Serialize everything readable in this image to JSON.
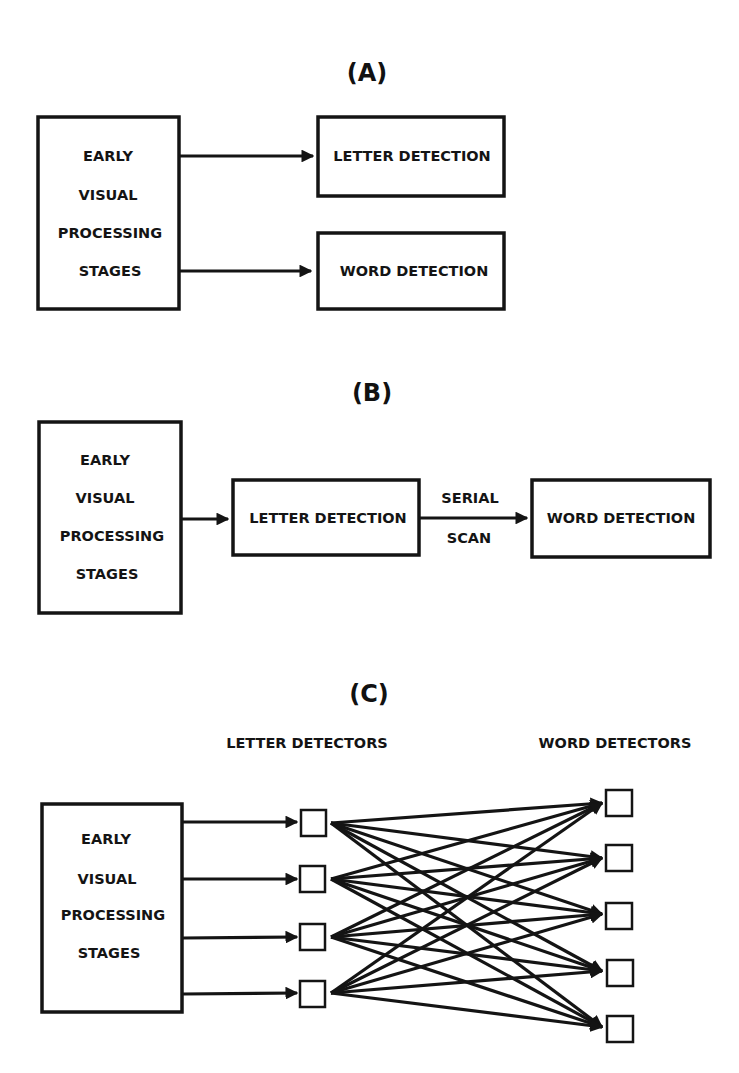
{
  "colors": {
    "ink": "#141414",
    "background": "#ffffff"
  },
  "panels": [
    {
      "id": "A",
      "title": "(A)",
      "source": {
        "lines": [
          "EARLY",
          "VISUAL",
          "PROCESSING",
          "STAGES"
        ]
      },
      "targets": [
        {
          "label": "LETTER DETECTION"
        },
        {
          "label": "WORD DETECTION"
        }
      ],
      "edges": [
        {
          "from": "EARLY VISUAL PROCESSING STAGES",
          "to": "LETTER DETECTION"
        },
        {
          "from": "EARLY VISUAL PROCESSING STAGES",
          "to": "WORD DETECTION"
        }
      ]
    },
    {
      "id": "B",
      "title": "(B)",
      "source": {
        "lines": [
          "EARLY",
          "VISUAL",
          "PROCESSING",
          "STAGES"
        ]
      },
      "middle": {
        "label": "LETTER DETECTION"
      },
      "target": {
        "label": "WORD DETECTION"
      },
      "edge_label": {
        "top": "SERIAL",
        "bottom": "SCAN"
      },
      "edges": [
        {
          "from": "EARLY VISUAL PROCESSING STAGES",
          "to": "LETTER DETECTION"
        },
        {
          "from": "LETTER DETECTION",
          "to": "WORD DETECTION",
          "label": "SERIAL SCAN"
        }
      ]
    },
    {
      "id": "C",
      "title": "(C)",
      "source": {
        "lines": [
          "EARLY",
          "VISUAL",
          "PROCESSING",
          "STAGES"
        ]
      },
      "letter_detectors": {
        "heading": "LETTER DETECTORS",
        "count": 4
      },
      "word_detectors": {
        "heading": "WORD DETECTORS",
        "count": 5
      },
      "connectivity": "each of 4 letter detectors connects to each of 5 word detectors (20 arrows)"
    }
  ]
}
